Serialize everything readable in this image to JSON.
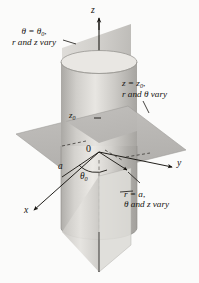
{
  "figure": {
    "type": "diagram",
    "width": 199,
    "height": 283,
    "background_color": "#fbfbfa"
  },
  "axes": {
    "z": "z",
    "y": "y",
    "x": "x",
    "origin": "0"
  },
  "marks": {
    "z0": "z",
    "z0_sub": "0",
    "a": "a",
    "theta0": "θ",
    "theta0_sub": "0"
  },
  "callouts": {
    "theta_plane": {
      "line1_lead": "θ = θ",
      "line1_sub": "0",
      "line1_tail": ",",
      "line2": "r and z vary"
    },
    "z_plane": {
      "line1_lead": "z = z",
      "line1_sub": "0",
      "line1_tail": ",",
      "line2": "r and θ vary"
    },
    "r_cylinder": {
      "line1_lead": "r = a",
      "line1_sub": "",
      "line1_tail": ",",
      "line2": "θ and z vary"
    }
  },
  "colors": {
    "ink": "#15130f",
    "plane_horizontal": "#b6b6b4",
    "plane_vertical_light": "#d7d5d1",
    "plane_vertical_dark": "#bdbbb7",
    "cylinder_light": "#e6e4e0",
    "cylinder_mid": "#c9c7c3",
    "cylinder_dark": "#a9a7a3",
    "paper": "#fbfbfa"
  },
  "geometry": {
    "cylinder_radius_px": 38,
    "cylinder_top_y": 62,
    "cylinder_bottom_y": 228,
    "axis_top_y": 18,
    "axis_bottom_y": 272,
    "origin_px": [
      99,
      152
    ]
  }
}
